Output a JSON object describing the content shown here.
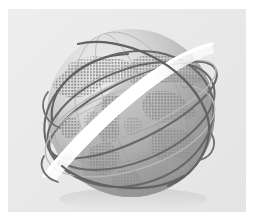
{
  "artwork": {
    "title": "Global Network Globe",
    "subject": "wireframe globe with orbiting rings",
    "caption": "",
    "background_color": "#ffffff",
    "panel_color": "#eaeaea",
    "globe_light_color": "#e0e0e0",
    "globe_mid_color": "#b4b4b4",
    "globe_dark_color": "#8d8d8d",
    "continent_dot_color": "#9a9a9a",
    "orbit_ring_color": "#6d6d6d",
    "highlight_band_color": "#ffffff",
    "shadow_color": "#d5d5d5"
  },
  "panel": {
    "label": "illustration-panel",
    "x": 8,
    "y": 9,
    "width": 238,
    "height": 203
  },
  "globe": {
    "label": "globe",
    "center_x": 131,
    "center_y": 113,
    "radius": 84
  },
  "elements": {
    "sphere_label": "sphere-body",
    "continents_label": "halftone-continents",
    "rings_label": "orbit-rings",
    "highlight_label": "highlight-swoosh",
    "grid_label": "latitude-grid"
  }
}
